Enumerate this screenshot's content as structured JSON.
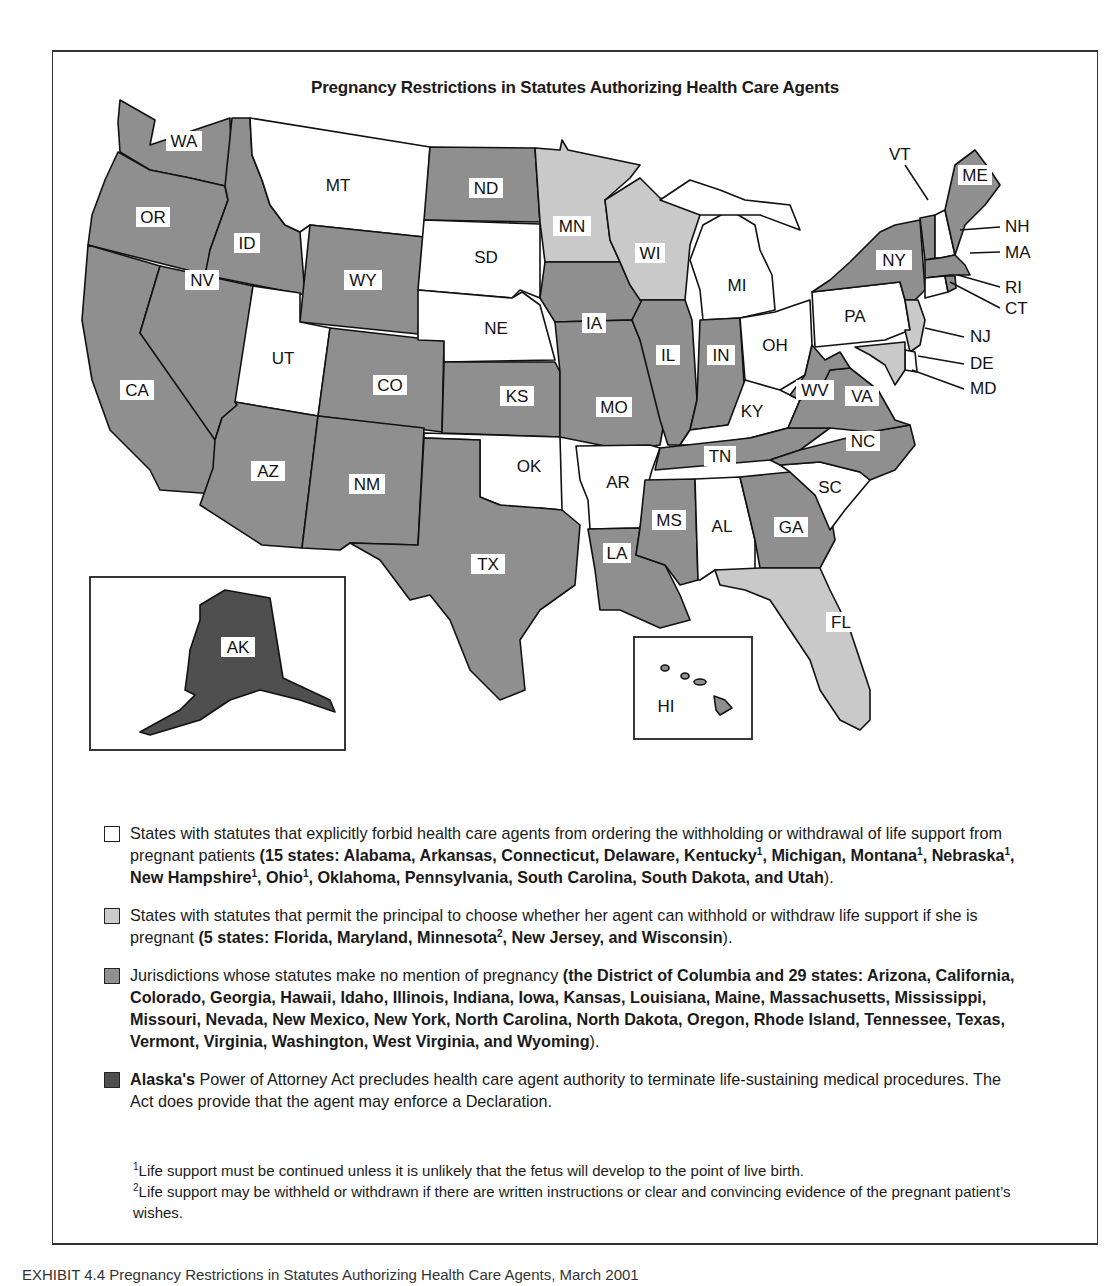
{
  "title": "Pregnancy Restrictions in Statutes Authorizing Health Care Agents",
  "colors": {
    "forbid": "#ffffff",
    "permit": "#c9c9c9",
    "no_mention": "#8f8f8f",
    "alaska": "#4f4f4f",
    "outline": "#111111"
  },
  "map": {
    "states": {
      "WA": "WA",
      "OR": "OR",
      "CA": "CA",
      "ID": "ID",
      "NV": "NV",
      "MT": "MT",
      "WY": "WY",
      "UT": "UT",
      "CO": "CO",
      "AZ": "AZ",
      "NM": "NM",
      "ND": "ND",
      "SD": "SD",
      "NE": "NE",
      "KS": "KS",
      "OK": "OK",
      "TX": "TX",
      "MN": "MN",
      "IA": "IA",
      "MO": "MO",
      "AR": "AR",
      "LA": "LA",
      "WI": "WI",
      "IL": "IL",
      "MS": "MS",
      "MI": "MI",
      "IN": "IN",
      "KY": "KY",
      "TN": "TN",
      "AL": "AL",
      "OH": "OH",
      "GA": "GA",
      "FL": "FL",
      "SC": "SC",
      "NC": "NC",
      "VA": "VA",
      "WV": "WV",
      "PA": "PA",
      "NY": "NY",
      "ME": "ME",
      "AK": "AK",
      "HI": "HI"
    },
    "callouts": {
      "VT": "VT",
      "NH": "NH",
      "MA": "MA",
      "RI": "RI",
      "CT": "CT",
      "NJ": "NJ",
      "DE": "DE",
      "MD": "MD"
    },
    "categories": {
      "forbid": [
        "AL",
        "AR",
        "CT",
        "DE",
        "KY",
        "MI",
        "MT",
        "NE",
        "NH",
        "OH",
        "OK",
        "PA",
        "SC",
        "SD",
        "UT"
      ],
      "permit": [
        "FL",
        "MD",
        "MN",
        "NJ",
        "WI"
      ],
      "no_mention": [
        "DC",
        "AZ",
        "CA",
        "CO",
        "GA",
        "HI",
        "ID",
        "IL",
        "IN",
        "IA",
        "KS",
        "LA",
        "ME",
        "MA",
        "MS",
        "MO",
        "NV",
        "NM",
        "NY",
        "NC",
        "ND",
        "OR",
        "RI",
        "TN",
        "TX",
        "VT",
        "VA",
        "WA",
        "WV",
        "WY"
      ],
      "alaska": [
        "AK"
      ]
    }
  },
  "legend": {
    "forbid": {
      "text": "States with statutes that explicitly forbid health care agents from ordering the withholding or withdrawal of life support from pregnant patients ",
      "bold_open": "(15 states: Alabama, Arkansas, Connecticut, Delaware, Kentucky",
      "s1": "1",
      "b2": ", Michigan, Montana",
      "s2": "1",
      "b3": ", Nebraska",
      "s3": "1",
      "b4": ", New Hampshire",
      "s4": "1",
      "b5": ", Ohio",
      "s5": "1",
      "b6": ", Oklahoma, Pennsylvania, South Carolina, South Dakota, and Utah",
      "close": ")."
    },
    "permit": {
      "text": "States with statutes that permit the principal to choose whether her agent can withhold or withdraw life support if she is pregnant ",
      "b1": "(5 states: Florida, Maryland, Minnesota",
      "s1": "2",
      "b2": ", New Jersey, and Wisconsin",
      "close": ")."
    },
    "no_mention": {
      "text": "Jurisdictions whose statutes make no mention of pregnancy ",
      "b1": "(the District of Columbia and 29 states: Arizona, California, Colorado, Georgia, Hawaii, Idaho, Illinois, Indiana, Iowa, Kansas, Louisiana, Maine, Massachusetts, Mississippi, Missouri, Nevada, New Mexico, New York, North Carolina, North Dakota, Oregon, Rhode Island, Tennessee, Texas, Vermont, Virginia, Washington, West Virginia, and Wyoming",
      "close": ")."
    },
    "alaska": {
      "b1": "Alaska's",
      "text": " Power of Attorney Act precludes health care agent authority to terminate life-sustaining medical procedures. The Act does provide that the agent may enforce a Declaration."
    }
  },
  "footnotes": [
    {
      "mark": "1",
      "text": "Life support must be continued unless it is unlikely that the fetus will develop to the point of live birth."
    },
    {
      "mark": "2",
      "text": "Life support may be withheld or withdrawn if there are written instructions or clear and convincing evidence of the pregnant patient’s wishes."
    }
  ],
  "caption": "EXHIBIT 4.4   Pregnancy Restrictions in Statutes Authorizing Health Care Agents, March 2001"
}
